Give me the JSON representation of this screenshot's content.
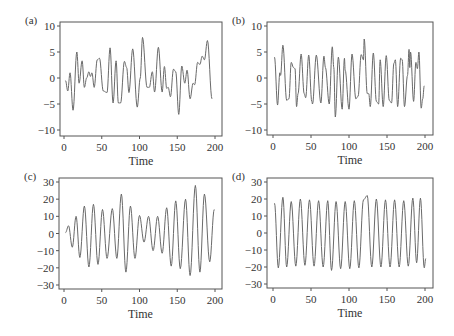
{
  "figure": {
    "width": 454,
    "height": 336,
    "line_color": "#6a6a6a",
    "axis_color": "#555555"
  },
  "chart_data": [
    {
      "id": "a",
      "type": "line",
      "panel_label": "(a)",
      "title": "",
      "xlabel": "Time",
      "ylabel": "",
      "xlim": [
        0,
        200
      ],
      "ylim": [
        -10,
        10
      ],
      "xticks": [
        0,
        50,
        100,
        150,
        200
      ],
      "yticks": [
        -10,
        -5,
        0,
        5,
        10
      ],
      "grid": false,
      "box": {
        "left": 60,
        "top": 22,
        "right": 222,
        "bottom": 136
      },
      "x_px": [
        64,
        215
      ],
      "y_px": [
        130,
        26
      ],
      "points": [
        [
          2,
          -0.5
        ],
        [
          5,
          -2.5
        ],
        [
          8,
          1
        ],
        [
          12,
          -6.2
        ],
        [
          17,
          5
        ],
        [
          20,
          -1
        ],
        [
          24,
          3.3
        ],
        [
          27,
          -1.8
        ],
        [
          30,
          0
        ],
        [
          33,
          1.2
        ],
        [
          35,
          0.3
        ],
        [
          37,
          1
        ],
        [
          40,
          -1.8
        ],
        [
          44,
          3.5
        ],
        [
          47,
          3.8
        ],
        [
          52,
          -2.5
        ],
        [
          57,
          -2.8
        ],
        [
          61,
          5.8
        ],
        [
          65,
          -4.8
        ],
        [
          69,
          3.3
        ],
        [
          72,
          -4.8
        ],
        [
          75,
          -4.8
        ],
        [
          80,
          3.2
        ],
        [
          83,
          2
        ],
        [
          86,
          -2.8
        ],
        [
          91,
          5.6
        ],
        [
          97,
          -5.6
        ],
        [
          101,
          0
        ],
        [
          104,
          7.8
        ],
        [
          110,
          -1.8
        ],
        [
          113,
          -1.8
        ],
        [
          117,
          1.2
        ],
        [
          120,
          -2.7
        ],
        [
          125,
          5.9
        ],
        [
          130,
          -2.7
        ],
        [
          133,
          2.2
        ],
        [
          136,
          -2
        ],
        [
          138,
          -1.8
        ],
        [
          141,
          -3.6
        ],
        [
          145,
          1.7
        ],
        [
          148,
          1.2
        ],
        [
          152,
          -7
        ],
        [
          156,
          2.3
        ],
        [
          160,
          -1
        ],
        [
          163,
          1.5
        ],
        [
          167,
          -4
        ],
        [
          171,
          -1
        ],
        [
          173,
          -1.3
        ],
        [
          177,
          3
        ],
        [
          180,
          2.6
        ],
        [
          183,
          4.2
        ],
        [
          186,
          3.5
        ],
        [
          190,
          7.2
        ],
        [
          196,
          -4
        ]
      ]
    },
    {
      "id": "b",
      "type": "line",
      "panel_label": "(b)",
      "title": "",
      "xlabel": "Time",
      "ylabel": "",
      "xlim": [
        0,
        200
      ],
      "ylim": [
        -10,
        10
      ],
      "xticks": [
        0,
        50,
        100,
        150,
        200
      ],
      "yticks": [
        -10,
        -5,
        0,
        5,
        10
      ],
      "grid": false,
      "box": {
        "left": 267,
        "top": 22,
        "right": 433,
        "bottom": 135
      },
      "x_px": [
        273,
        425
      ],
      "y_px": [
        130,
        26
      ],
      "points": [
        [
          2,
          4
        ],
        [
          6,
          -5.2
        ],
        [
          9,
          1
        ],
        [
          10,
          0.5
        ],
        [
          13,
          6.3
        ],
        [
          18,
          -4.3
        ],
        [
          21,
          -4
        ],
        [
          24,
          3
        ],
        [
          27,
          2
        ],
        [
          29,
          1.8
        ],
        [
          31,
          -5.5
        ],
        [
          33,
          -3
        ],
        [
          37,
          4.6
        ],
        [
          41,
          -3
        ],
        [
          43,
          -3.8
        ],
        [
          47,
          4.4
        ],
        [
          51,
          -4.5
        ],
        [
          52,
          -5
        ],
        [
          57,
          4.4
        ],
        [
          63,
          -4.8
        ],
        [
          67,
          4.2
        ],
        [
          69,
          2
        ],
        [
          74,
          -5
        ],
        [
          78,
          6
        ],
        [
          80,
          2
        ],
        [
          82,
          -7.5
        ],
        [
          86,
          4
        ],
        [
          91,
          -6
        ],
        [
          94,
          3.8
        ],
        [
          95,
          1.5
        ],
        [
          100,
          -6
        ],
        [
          104,
          4.6
        ],
        [
          109,
          -4
        ],
        [
          112,
          -3.5
        ],
        [
          116,
          4.5
        ],
        [
          119,
          3.5
        ],
        [
          120,
          7.5
        ],
        [
          124,
          -3
        ],
        [
          126,
          -3
        ],
        [
          128,
          -5.5
        ],
        [
          132,
          4.8
        ],
        [
          136,
          -4.5
        ],
        [
          139,
          -5
        ],
        [
          141,
          3.5
        ],
        [
          145,
          -5.5
        ],
        [
          149,
          4.3
        ],
        [
          153,
          -4.3
        ],
        [
          156,
          -4.8
        ],
        [
          159,
          2.8
        ],
        [
          161,
          3.5
        ],
        [
          164,
          -5.5
        ],
        [
          168,
          3.8
        ],
        [
          170,
          3.5
        ],
        [
          173,
          -5.5
        ],
        [
          177,
          0.5
        ],
        [
          179,
          5.5
        ],
        [
          180,
          2
        ],
        [
          181,
          5
        ],
        [
          185,
          -4.5
        ],
        [
          188,
          3
        ],
        [
          190,
          1.8
        ],
        [
          192,
          5
        ],
        [
          195,
          -5.8
        ],
        [
          197,
          -4
        ],
        [
          199,
          -1.5
        ]
      ]
    },
    {
      "id": "c",
      "type": "line",
      "panel_label": "(c)",
      "title": "",
      "xlabel": "Time",
      "ylabel": "",
      "xlim": [
        0,
        200
      ],
      "ylim": [
        -30,
        30
      ],
      "xticks": [
        0,
        50,
        100,
        150,
        200
      ],
      "yticks": [
        -30,
        -20,
        -10,
        0,
        10,
        20,
        30
      ],
      "grid": false,
      "box": {
        "left": 59,
        "top": 178,
        "right": 222,
        "bottom": 289
      },
      "x_px": [
        64,
        215
      ],
      "y_px": [
        285,
        182
      ],
      "points": [
        [
          2,
          0.5
        ],
        [
          6,
          4.5
        ],
        [
          11,
          -8
        ],
        [
          16,
          10
        ],
        [
          21,
          -14
        ],
        [
          27,
          16
        ],
        [
          33,
          -19.5
        ],
        [
          39,
          17
        ],
        [
          45,
          -18
        ],
        [
          51,
          14
        ],
        [
          57,
          -14.5
        ],
        [
          64,
          14.5
        ],
        [
          70,
          -14.5
        ],
        [
          76,
          23
        ],
        [
          82,
          -22.5
        ],
        [
          88,
          16
        ],
        [
          94,
          -14.5
        ],
        [
          100,
          10.5
        ],
        [
          106,
          -5
        ],
        [
          112,
          10
        ],
        [
          118,
          -10
        ],
        [
          124,
          10
        ],
        [
          130,
          -11.5
        ],
        [
          136,
          15
        ],
        [
          142,
          -19
        ],
        [
          148,
          19
        ],
        [
          154,
          -20.5
        ],
        [
          161,
          20
        ],
        [
          167,
          -24.5
        ],
        [
          174,
          28
        ],
        [
          180,
          -22.5
        ],
        [
          186,
          23
        ],
        [
          193,
          -16.5
        ],
        [
          199,
          14
        ]
      ]
    },
    {
      "id": "d",
      "type": "line",
      "panel_label": "(d)",
      "title": "",
      "xlabel": "Time",
      "ylabel": "",
      "xlim": [
        0,
        200
      ],
      "ylim": [
        -30,
        30
      ],
      "xticks": [
        0,
        50,
        100,
        150,
        200
      ],
      "yticks": [
        -30,
        -20,
        -10,
        0,
        10,
        20,
        30
      ],
      "grid": false,
      "box": {
        "left": 267,
        "top": 178,
        "right": 433,
        "bottom": 288
      },
      "x_px": [
        273,
        425
      ],
      "y_px": [
        284,
        182
      ],
      "points": [
        [
          2,
          17.5
        ],
        [
          7,
          -20.5
        ],
        [
          13,
          21
        ],
        [
          18,
          -20
        ],
        [
          24,
          18.5
        ],
        [
          30,
          -19.5
        ],
        [
          36,
          20
        ],
        [
          42,
          -19
        ],
        [
          48,
          19.5
        ],
        [
          54,
          -19.5
        ],
        [
          60,
          19
        ],
        [
          66,
          -20
        ],
        [
          72,
          19
        ],
        [
          77,
          -22
        ],
        [
          83,
          18.5
        ],
        [
          89,
          -21
        ],
        [
          95,
          18.5
        ],
        [
          101,
          -21
        ],
        [
          107,
          19
        ],
        [
          113,
          -20.5
        ],
        [
          119,
          19.5
        ],
        [
          124,
          22
        ],
        [
          130,
          -20
        ],
        [
          136,
          20
        ],
        [
          142,
          -20
        ],
        [
          148,
          19.5
        ],
        [
          154,
          -20
        ],
        [
          160,
          19.5
        ],
        [
          166,
          -20
        ],
        [
          172,
          19
        ],
        [
          178,
          -19.5
        ],
        [
          184,
          20.5
        ],
        [
          189,
          -17.5
        ],
        [
          194,
          20.5
        ],
        [
          199,
          -20.5
        ],
        [
          201,
          -15
        ]
      ]
    }
  ]
}
